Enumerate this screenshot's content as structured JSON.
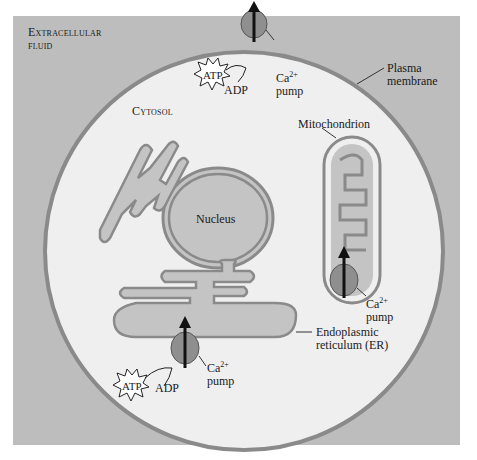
{
  "labels": {
    "extracellular": "Extracellular fluid",
    "extracellular_line1": "Extracellular",
    "extracellular_line2": "fluid",
    "cytosol": "Cytosol",
    "plasma_membrane_line1": "Plasma",
    "plasma_membrane_line2": "membrane",
    "mitochondrion": "Mitochondrion",
    "nucleus": "Nucleus",
    "er_line1": "Endoplasmic",
    "er_line2": "reticulum (ER)"
  },
  "pumps": [
    {
      "location": "plasma-membrane",
      "ion": "Ca",
      "charge": "2+",
      "word": "pump",
      "atp": "ATP",
      "adp": "ADP"
    },
    {
      "location": "mitochondrion",
      "ion": "Ca",
      "charge": "2+",
      "word": "pump"
    },
    {
      "location": "endoplasmic-reticulum",
      "ion": "Ca",
      "charge": "2+",
      "word": "pump",
      "atp": "ATP",
      "adp": "ADP"
    }
  ],
  "colors": {
    "background_panel": "#bdbdbd",
    "cytosol": "#efefef",
    "membrane": "#8a8a8a",
    "organelle_fill": "#c4c4c4",
    "pump": "#8f8f8f"
  }
}
